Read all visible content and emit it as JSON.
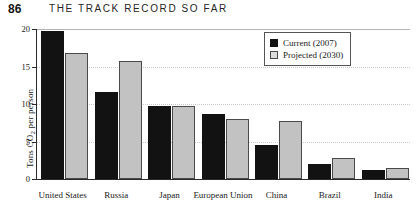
{
  "header": {
    "page_number": "86",
    "running_head": "THE TRACK RECORD SO FAR"
  },
  "legend": {
    "position": "top-right",
    "items": [
      {
        "label": "Current (2007)",
        "swatch": "black-square-icon",
        "color": "#121212"
      },
      {
        "label": "Projected (2030)",
        "swatch": "gray-square-icon",
        "color": "#c2c2c2"
      }
    ]
  },
  "axes": {
    "y_label_prefix": "Tons CO",
    "y_label_sub": "2",
    "y_label_suffix": " per person",
    "y_ticks": [
      "0",
      "5",
      "10",
      "15",
      "20"
    ]
  },
  "chart_data": {
    "type": "bar",
    "title": "",
    "xlabel": "",
    "ylabel": "Tons CO2 per person",
    "ylim": [
      0,
      20
    ],
    "grid": true,
    "legend_position": "top-right",
    "categories": [
      "United States",
      "Russia",
      "Japan",
      "European Union",
      "China",
      "Brazil",
      "India"
    ],
    "series": [
      {
        "name": "Current (2007)",
        "color": "#121212",
        "values": [
          19.7,
          11.6,
          9.7,
          8.7,
          4.6,
          2.0,
          1.2
        ]
      },
      {
        "name": "Projected (2030)",
        "color": "#c2c2c2",
        "values": [
          16.8,
          15.7,
          9.7,
          8.0,
          7.7,
          2.8,
          1.5
        ]
      }
    ]
  }
}
